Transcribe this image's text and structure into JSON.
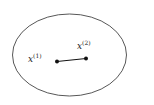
{
  "diagram": {
    "shape": "ellipse",
    "points": [
      {
        "label": "x",
        "superscript": "(1)"
      },
      {
        "label": "x",
        "superscript": "(2)"
      }
    ],
    "colors": {
      "stroke": "#444444",
      "point": "#111111",
      "text": "#222222"
    }
  }
}
